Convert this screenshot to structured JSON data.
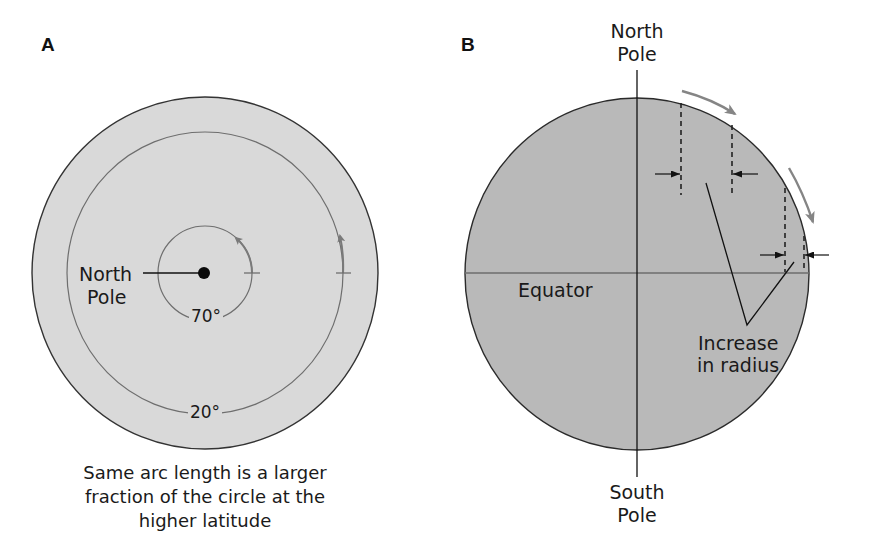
{
  "figure": {
    "panel_a": {
      "letter": "A",
      "pole_label_line1": "North",
      "pole_label_line2": "Pole",
      "inner_latitude": "70°",
      "outer_latitude": "20°",
      "caption_line1": "Same arc length is a larger",
      "caption_line2": "fraction of the circle at the",
      "caption_line3": "higher latitude",
      "colors": {
        "disc_fill": "#d9d9d9",
        "disc_stroke": "#333333",
        "latitude_ring": "#6e6e6e",
        "arc_arrow": "#7a7a7a"
      }
    },
    "panel_b": {
      "letter": "B",
      "north_label_line1": "North",
      "north_label_line2": "Pole",
      "south_label_line1": "South",
      "south_label_line2": "Pole",
      "equator_label": "Equator",
      "radius_label_line1": "Increase",
      "radius_label_line2": "in radius",
      "colors": {
        "disc_fill": "#b9b9b9",
        "disc_stroke": "#2a2a2a",
        "equator_line": "#6e6e6e",
        "arc_arrow": "#858585"
      }
    }
  }
}
